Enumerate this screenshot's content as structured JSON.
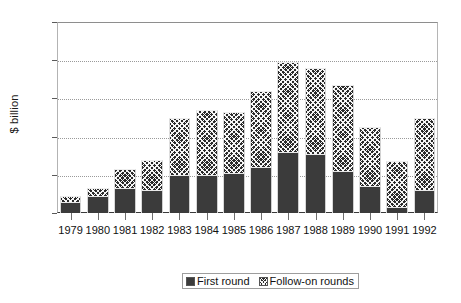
{
  "chart_data": {
    "type": "bar",
    "subtype": "stacked-vertical",
    "title": "",
    "xlabel": "",
    "ylabel": "$ billion",
    "ylim": [
      0,
      5
    ],
    "yticks": [
      0,
      1,
      2,
      3,
      4,
      5
    ],
    "ytick_labels": [
      "0",
      "1",
      "2",
      "3",
      "4",
      "5"
    ],
    "grid": "horizontal-dotted",
    "legend_position": "bottom-center",
    "categories": [
      "1979",
      "1980",
      "1981",
      "1982",
      "1983",
      "1984",
      "1985",
      "1986",
      "1987",
      "1988",
      "1989",
      "1990",
      "1991",
      "1992"
    ],
    "series": [
      {
        "name": "First round",
        "swatch": "solid",
        "color": "#3b3b3b",
        "values": [
          0.3,
          0.45,
          0.65,
          0.6,
          1.0,
          1.0,
          1.05,
          1.2,
          1.6,
          1.55,
          1.1,
          0.7,
          0.15,
          0.6
        ]
      },
      {
        "name": "Follow-on rounds",
        "swatch": "hatch",
        "color": "#2a2a2a",
        "values": [
          0.15,
          0.2,
          0.5,
          0.8,
          1.5,
          1.7,
          1.6,
          2.0,
          2.35,
          2.25,
          2.25,
          1.55,
          1.2,
          1.9
        ]
      }
    ],
    "totals": [
      0.45,
      0.65,
      1.15,
      1.4,
      2.5,
      2.7,
      2.65,
      3.2,
      3.95,
      3.8,
      3.35,
      2.25,
      1.35,
      2.5
    ]
  },
  "legend": {
    "entries": [
      {
        "label": "First round"
      },
      {
        "label": "Follow-on rounds"
      }
    ]
  },
  "axes": {
    "y_title": "$ billion"
  }
}
